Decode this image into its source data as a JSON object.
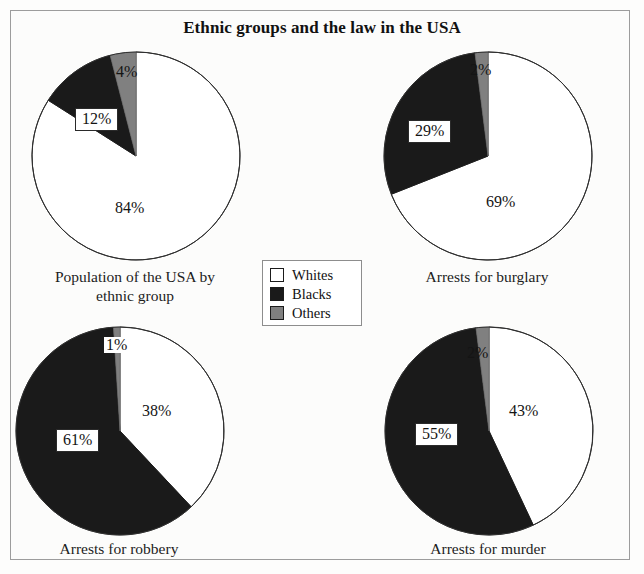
{
  "figure": {
    "title": "Ethnic groups and the law in the USA",
    "background_color": "#fcfcfb",
    "border_color": "#9c9c9c"
  },
  "legend": {
    "name": "ethnic-group-legend",
    "items": [
      {
        "label": "Whites",
        "color": "#ffffff"
      },
      {
        "label": "Blacks",
        "color": "#1a1a1a"
      },
      {
        "label": "Others",
        "color": "#808080"
      }
    ]
  },
  "chart_data": [
    {
      "type": "pie",
      "title": "Population of the USA by ethnic group",
      "title_line1": "Population of the USA by",
      "title_line2": "ethnic group",
      "categories": [
        "Whites",
        "Blacks",
        "Others"
      ],
      "values": [
        84,
        12,
        4
      ],
      "labels": [
        "84%",
        "12%",
        "4%"
      ],
      "colors": [
        "#ffffff",
        "#1a1a1a",
        "#808080"
      ],
      "start_angle_deg": 90,
      "direction": "counterclockwise",
      "units": "percent"
    },
    {
      "type": "pie",
      "title": "Arrests for burglary",
      "title_line1": "Arrests for burglary",
      "title_line2": "",
      "categories": [
        "Whites",
        "Blacks",
        "Others"
      ],
      "values": [
        69,
        29,
        2
      ],
      "labels": [
        "69%",
        "29%",
        "2%"
      ],
      "colors": [
        "#ffffff",
        "#1a1a1a",
        "#808080"
      ],
      "start_angle_deg": 90,
      "direction": "counterclockwise",
      "units": "percent"
    },
    {
      "type": "pie",
      "title": "Arrests for robbery",
      "title_line1": "Arrests for robbery",
      "title_line2": "",
      "categories": [
        "Whites",
        "Blacks",
        "Others"
      ],
      "values": [
        38,
        61,
        1
      ],
      "labels": [
        "38%",
        "61%",
        "1%"
      ],
      "colors": [
        "#ffffff",
        "#1a1a1a",
        "#808080"
      ],
      "start_angle_deg": 90,
      "direction": "counterclockwise",
      "units": "percent"
    },
    {
      "type": "pie",
      "title": "Arrests for murder",
      "title_line1": "Arrests for murder",
      "title_line2": "",
      "categories": [
        "Whites",
        "Blacks",
        "Others"
      ],
      "values": [
        43,
        55,
        2
      ],
      "labels": [
        "43%",
        "55%",
        "2%"
      ],
      "colors": [
        "#ffffff",
        "#1a1a1a",
        "#808080"
      ],
      "start_angle_deg": 90,
      "direction": "counterclockwise",
      "units": "percent"
    }
  ]
}
